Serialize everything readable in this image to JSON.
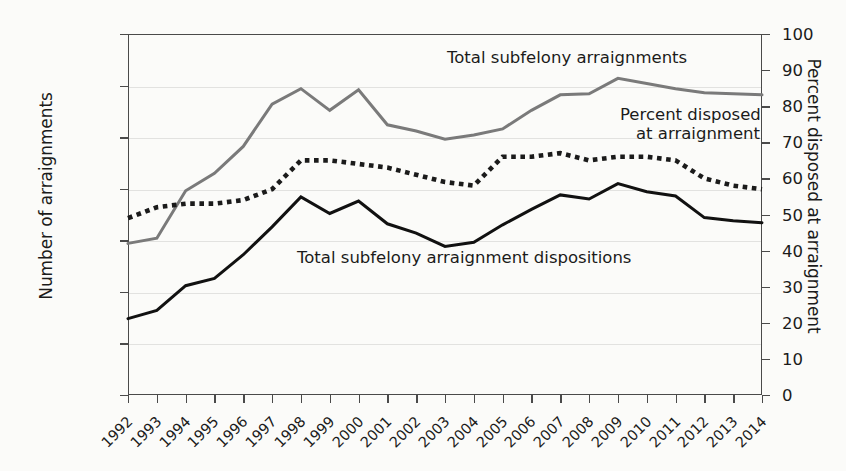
{
  "chart_data": {
    "type": "line",
    "title": "",
    "x": [
      1992,
      1993,
      1994,
      1995,
      1996,
      1997,
      1998,
      1999,
      2000,
      2001,
      2002,
      2003,
      2004,
      2005,
      2006,
      2007,
      2008,
      2009,
      2010,
      2011,
      2012,
      2013,
      2014
    ],
    "xlabel": "",
    "ylabel": "Number of arraignments",
    "ylabel_right": "Percent disposed at arraignment",
    "ylim": [
      0,
      350000
    ],
    "ylim_right": [
      0,
      100
    ],
    "yticks": [
      0,
      50000,
      100000,
      150000,
      200000,
      250000,
      300000,
      350000
    ],
    "ytick_labels": [
      "0",
      "50,000",
      "100,000",
      "150,000",
      "200,000",
      "250,000",
      "300,000",
      "350,000"
    ],
    "yticks_right": [
      0,
      10,
      20,
      30,
      40,
      50,
      60,
      70,
      80,
      90,
      100
    ],
    "ytick_labels_right": [
      "0",
      "10",
      "20",
      "30",
      "40",
      "50",
      "60",
      "70",
      "80",
      "90",
      "100"
    ],
    "grid": true,
    "legend_position": "inline-annotations",
    "series": [
      {
        "name": "Total subfelony arraignments",
        "axis": "left",
        "style": "solid",
        "color": "#7a7a7a",
        "values": [
          147000,
          152000,
          198000,
          215000,
          241000,
          282000,
          297000,
          276000,
          296000,
          262000,
          256000,
          248000,
          252000,
          258000,
          276000,
          291000,
          292000,
          307000,
          302000,
          297000,
          293000,
          292000,
          291000
        ]
      },
      {
        "name": "Percent disposed at arraignment",
        "axis": "right",
        "style": "dotted",
        "color": "#1b1b1b",
        "values": [
          49,
          52,
          53,
          53,
          54,
          57,
          65,
          65,
          64,
          63,
          61,
          59,
          58,
          66,
          66,
          67,
          65,
          66,
          66,
          65,
          60,
          58,
          57
        ]
      },
      {
        "name": "Total subfelony arraignment dispositions",
        "axis": "left",
        "style": "solid",
        "color": "#111111",
        "values": [
          74000,
          82000,
          106000,
          113000,
          136000,
          163000,
          192000,
          176000,
          188000,
          166000,
          157000,
          144000,
          148000,
          165000,
          180000,
          194000,
          190000,
          205000,
          197000,
          193000,
          172000,
          169000,
          167000
        ]
      }
    ]
  },
  "annotations": {
    "gray_label": "Total subfelony arraignments",
    "dotted_label_line1": "Percent disposed",
    "dotted_label_line2": "at arraignment",
    "black_label": "Total subfelony arraignment dispositions"
  },
  "axes": {
    "left_title": "Number of arraignments",
    "right_title": "Percent disposed at arraignment"
  },
  "colors": {
    "gray_series": "#7a7a7a",
    "dotted_series": "#1b1b1b",
    "black_series": "#111111",
    "gridline": "#e2e2e0",
    "axis": "#4a4a4a",
    "background": "#fbfbf9"
  }
}
